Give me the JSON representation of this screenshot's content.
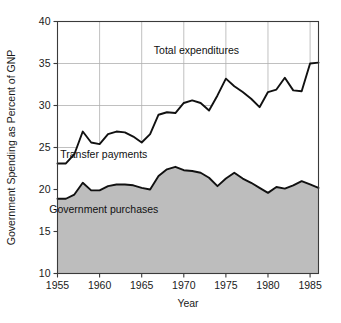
{
  "chart_data": {
    "type": "area",
    "title": "",
    "subtitle": "",
    "xlabel": "Year",
    "ylabel": "Government Spending as Percent of GNP",
    "xlim": [
      1955,
      1986
    ],
    "ylim": [
      10,
      40
    ],
    "xticks": [
      1955,
      1960,
      1965,
      1970,
      1975,
      1980,
      1985
    ],
    "yticks": [
      10,
      15,
      20,
      25,
      30,
      35,
      40
    ],
    "grid": true,
    "grid_color": "#b0b0b0",
    "fill_color": "#bdbdbd",
    "line_color": "#111111",
    "frame_color": "#3a3a3a",
    "background": "#ffffff",
    "legend_position": "inline-annotations",
    "annotations": [
      {
        "text": "Total expenditures",
        "x": 1971.5,
        "y": 36.6
      },
      {
        "text": "Transfer payments",
        "x": 1960.5,
        "y": 24.2
      },
      {
        "text": "Government purchases",
        "x": 1960.5,
        "y": 17.6
      }
    ],
    "x": [
      1955,
      1956,
      1957,
      1958,
      1959,
      1960,
      1961,
      1962,
      1963,
      1964,
      1965,
      1966,
      1967,
      1968,
      1969,
      1970,
      1971,
      1972,
      1973,
      1974,
      1975,
      1976,
      1977,
      1978,
      1979,
      1980,
      1981,
      1982,
      1983,
      1984,
      1985,
      1986
    ],
    "series": [
      {
        "name": "Total expenditures",
        "role": "upper-boundary",
        "values": [
          23.1,
          23.1,
          24.2,
          26.9,
          25.6,
          25.4,
          26.6,
          26.9,
          26.8,
          26.3,
          25.6,
          26.6,
          28.9,
          29.2,
          29.1,
          30.3,
          30.6,
          30.3,
          29.4,
          31.2,
          33.2,
          32.3,
          31.6,
          30.8,
          29.8,
          31.6,
          31.9,
          33.3,
          31.8,
          31.7,
          35.0,
          35.1
        ]
      },
      {
        "name": "Government purchases",
        "role": "lower-boundary",
        "values": [
          18.9,
          18.9,
          19.4,
          20.8,
          19.9,
          19.9,
          20.4,
          20.6,
          20.6,
          20.5,
          20.2,
          20.0,
          21.6,
          22.4,
          22.7,
          22.3,
          22.2,
          22.0,
          21.4,
          20.4,
          21.3,
          22.0,
          21.3,
          20.8,
          20.2,
          19.6,
          20.3,
          20.1,
          20.5,
          21.0,
          20.6,
          20.2
        ]
      }
    ],
    "derived_series": [
      {
        "name": "Transfer payments",
        "note": "Vertical distance between Total expenditures and Government purchases",
        "values": [
          4.2,
          4.2,
          4.8,
          6.1,
          5.7,
          5.5,
          6.2,
          6.3,
          6.2,
          5.8,
          5.4,
          6.6,
          7.3,
          6.8,
          6.4,
          8.0,
          8.4,
          8.3,
          8.0,
          10.8,
          11.9,
          10.3,
          10.3,
          10.0,
          9.6,
          12.0,
          11.6,
          13.2,
          11.3,
          10.7,
          14.4,
          14.9
        ]
      }
    ]
  }
}
